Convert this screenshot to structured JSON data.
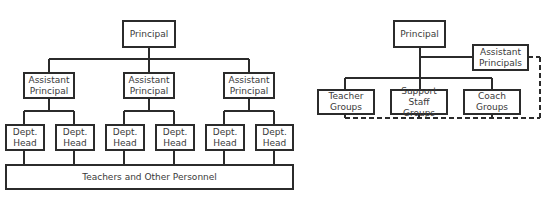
{
  "left_chart": {
    "principal": "Principal",
    "assistant_principals": [
      "Assistant\nPrincipal",
      "Assistant\nPrincipal",
      "Assistant\nPrincipal"
    ],
    "dept_heads": [
      "Dept.\nHead",
      "Dept.\nHead",
      "Dept.\nHead",
      "Dept.\nHead",
      "Dept.\nHead",
      "Dept.\nHead"
    ],
    "personnel": "Teachers and Other Personnel"
  },
  "right_chart": {
    "principal": "Principal",
    "assistant_principals": "Assistant\nPrincipals",
    "groups": [
      "Teacher\nGroups",
      "Support\nStaff Groups",
      "Coach\nGroups"
    ]
  },
  "colors": {
    "line": "#2b2b2b",
    "background": "#ffffff"
  }
}
